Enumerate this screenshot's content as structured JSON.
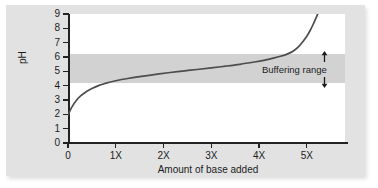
{
  "chart_data": {
    "type": "line",
    "title": "",
    "xlabel": "Amount of base added",
    "ylabel": "pH",
    "xlim": [
      0,
      5.8
    ],
    "ylim": [
      0,
      9
    ],
    "grid": false,
    "legend": null,
    "x_tick_labels": [
      "0",
      "1X",
      "2X",
      "3X",
      "4X",
      "5X"
    ],
    "x_tick_values": [
      0,
      1,
      2,
      3,
      4,
      5
    ],
    "y_tick_labels": [
      "0",
      "1",
      "2",
      "3",
      "4",
      "5",
      "6",
      "7",
      "8",
      "9"
    ],
    "y_tick_values": [
      0,
      1,
      2,
      3,
      4,
      5,
      6,
      7,
      8,
      9
    ],
    "series": [
      {
        "name": "Titration curve",
        "color": "#4d4d4d",
        "x": [
          0.0,
          0.08,
          0.17,
          0.27,
          0.38,
          0.5,
          0.65,
          0.8,
          1.0,
          1.25,
          1.5,
          1.8,
          2.1,
          2.4,
          2.7,
          3.0,
          3.3,
          3.6,
          3.9,
          4.1,
          4.3,
          4.45,
          4.6,
          4.72,
          4.83,
          4.92,
          5.0,
          5.07,
          5.13,
          5.18,
          5.23
        ],
        "y": [
          1.95,
          2.5,
          2.95,
          3.3,
          3.58,
          3.8,
          4.02,
          4.18,
          4.34,
          4.5,
          4.63,
          4.77,
          4.9,
          5.02,
          5.13,
          5.24,
          5.36,
          5.49,
          5.65,
          5.77,
          5.92,
          6.05,
          6.22,
          6.42,
          6.72,
          7.08,
          7.45,
          7.85,
          8.25,
          8.62,
          9.0
        ]
      }
    ],
    "shaded_regions": [
      {
        "name": "buffering-range",
        "orientation": "horizontal",
        "y_from": 4.2,
        "y_to": 6.2,
        "color": "#d2d2d2",
        "label": "Buffering range"
      }
    ],
    "annotations": [
      {
        "name": "buffering-range-annotation",
        "text": "Buffering range",
        "arrow_up_icon": "arrow-up-icon",
        "arrow_down_icon": "arrow-down-icon"
      }
    ]
  },
  "axes": {
    "y_title": "pH",
    "x_title": "Amount of base added"
  },
  "colors": {
    "card_background": "#e2e2e2",
    "plot_background": "#ffffff",
    "band": "#d2d2d2",
    "curve": "#4d4d4d",
    "axis": "#222222",
    "text": "#1c1c1c"
  }
}
